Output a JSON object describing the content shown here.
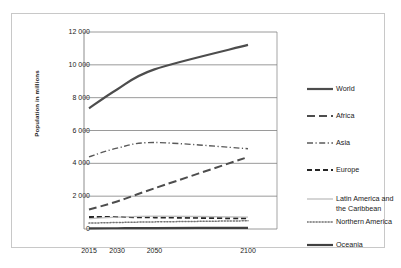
{
  "chart_data": {
    "type": "line",
    "title": "",
    "subtitle": "",
    "xlabel": "",
    "ylabel": "Population in millions",
    "xlim": [
      2015,
      2100
    ],
    "ylim": [
      0,
      12000
    ],
    "grid": true,
    "grid_axis": "y",
    "legend_position": "right",
    "x": [
      2015,
      2030,
      2050,
      2100
    ],
    "xtick_labels": [
      "2015",
      "2030",
      "2050",
      "2100"
    ],
    "ytick_values": [
      0,
      2000,
      4000,
      6000,
      8000,
      10000,
      12000
    ],
    "ytick_labels": [
      "0",
      "2 000",
      "4 000",
      "6 000",
      "8 000",
      "10 000",
      "12 000"
    ],
    "series": [
      {
        "name": "World",
        "values": [
          7349,
          8501,
          9725,
          11213
        ],
        "style": "solid",
        "color": "#4d4d4d",
        "width": 2.2
      },
      {
        "name": "Africa",
        "values": [
          1186,
          1679,
          2478,
          4387
        ],
        "style": "long-dash",
        "color": "#4d4d4d",
        "width": 2.0
      },
      {
        "name": "Asia",
        "values": [
          4393,
          4923,
          5267,
          4889
        ],
        "style": "dash-dot",
        "color": "#595959",
        "width": 1.4
      },
      {
        "name": "Europe",
        "values": [
          738,
          734,
          707,
          646
        ],
        "style": "dashed",
        "color": "#262626",
        "width": 2.0
      },
      {
        "name": "Latin America and the Caribbean",
        "values": [
          634,
          721,
          784,
          721
        ],
        "style": "solid-light",
        "color": "#bfbfbf",
        "width": 1.3
      },
      {
        "name": "Northern America",
        "values": [
          358,
          396,
          433,
          500
        ],
        "style": "dotted",
        "color": "#737373",
        "width": 1.5
      },
      {
        "name": "Oceania",
        "values": [
          39,
          47,
          57,
          71
        ],
        "style": "solid",
        "color": "#404040",
        "width": 2.2
      }
    ]
  },
  "legend": {
    "entries": [
      {
        "label": "World"
      },
      {
        "label": "Africa"
      },
      {
        "label": "Asia"
      },
      {
        "label": "Europe"
      },
      {
        "label": "Latin America and\nthe Caribbean"
      },
      {
        "label": "Northern America"
      },
      {
        "label": "Oceania"
      }
    ]
  },
  "colors": {
    "frame_border": "#c8c8c8",
    "gridline": "#808080",
    "axis_line": "#808080",
    "text": "#222222",
    "background": "#ffffff"
  }
}
